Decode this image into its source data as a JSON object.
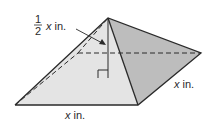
{
  "diagram": {
    "type": "square pyramid",
    "labels": {
      "height_numerator": "1",
      "height_denominator": "2",
      "height_var": "x",
      "height_unit": " in.",
      "base_front_var": "x",
      "base_front_unit": " in.",
      "base_side_var": "x",
      "base_side_unit": " in."
    },
    "colors": {
      "front_face": "#e4e4e4",
      "right_face": "#bdbdbd",
      "edge": "#2a2a2a"
    }
  }
}
